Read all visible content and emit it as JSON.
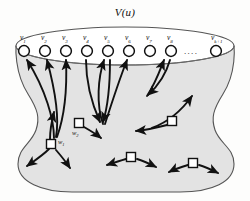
{
  "figure": {
    "title": "V(u)",
    "body_fill": "#e3e3e3",
    "outline_color": "#4a4a4a",
    "arrow_color": "#111111",
    "background": "#fdfdfc",
    "ellipsis": "....",
    "top_vertices": [
      {
        "id": "v1",
        "label": "v",
        "sub": "1",
        "cx": 24,
        "cy": 51
      },
      {
        "id": "v2",
        "label": "v",
        "sub": "2",
        "cx": 45,
        "cy": 51
      },
      {
        "id": "v3",
        "label": "v",
        "sub": "3",
        "cx": 66,
        "cy": 51
      },
      {
        "id": "v4",
        "label": "v",
        "sub": "4",
        "cx": 87,
        "cy": 51
      },
      {
        "id": "v5",
        "label": "v",
        "sub": "5",
        "cx": 108,
        "cy": 51
      },
      {
        "id": "v6",
        "label": "v",
        "sub": "6",
        "cx": 129,
        "cy": 51
      },
      {
        "id": "v7",
        "label": "v",
        "sub": "7",
        "cx": 150,
        "cy": 51
      },
      {
        "id": "v8",
        "label": "v",
        "sub": "8",
        "cx": 171,
        "cy": 51
      },
      {
        "id": "vk1",
        "label": "v",
        "sub": "k+1",
        "cx": 216,
        "cy": 51
      }
    ],
    "interior_nodes": [
      {
        "id": "w1",
        "label": "w",
        "sub": "1",
        "x": 51,
        "y": 144,
        "has_label": true
      },
      {
        "id": "w2",
        "label": "w",
        "sub": "2",
        "x": 79,
        "y": 123,
        "has_label": true
      },
      {
        "id": "w3",
        "label": "",
        "sub": "",
        "x": 172,
        "y": 121,
        "has_label": false
      },
      {
        "id": "w4",
        "label": "",
        "sub": "",
        "x": 131,
        "y": 157,
        "has_label": false
      },
      {
        "id": "w5",
        "label": "",
        "sub": "",
        "x": 193,
        "y": 163,
        "has_label": false
      }
    ]
  }
}
